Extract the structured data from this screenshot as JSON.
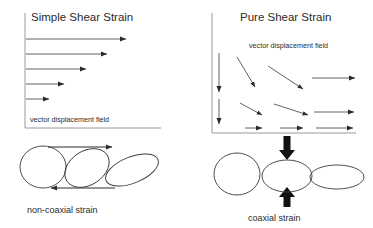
{
  "figure": {
    "width": 373,
    "height": 228,
    "background": "#ffffff",
    "ink_color": "#2b2b2b",
    "axis_color": "#9a9a9a"
  },
  "panels": {
    "left": {
      "title": "Simple Shear Strain",
      "field_label": "vector displacement field",
      "caption": "non-coaxial strain",
      "axis": {
        "vertical": {
          "x": 25,
          "y1": 13,
          "y2": 128
        },
        "horizontal": {
          "y": 128,
          "x1": 25,
          "x2": 161
        }
      },
      "vectors": [
        {
          "x1": 26,
          "y1": 39,
          "x2": 129,
          "y2": 39,
          "direction": "right"
        },
        {
          "x1": 26,
          "y1": 54,
          "x2": 110,
          "y2": 54,
          "direction": "right"
        },
        {
          "x1": 26,
          "y1": 69,
          "x2": 89,
          "y2": 69,
          "direction": "right"
        },
        {
          "x1": 26,
          "y1": 84,
          "x2": 67,
          "y2": 84,
          "direction": "right"
        },
        {
          "x1": 26,
          "y1": 99,
          "x2": 52,
          "y2": 99,
          "direction": "right"
        }
      ],
      "shear_arrows": [
        {
          "name": "top-shear-arrow",
          "x1": 48,
          "y1": 147,
          "x2": 115,
          "y2": 147,
          "direction": "right"
        },
        {
          "name": "bottom-shear-arrow",
          "x1": 115,
          "y1": 188,
          "x2": 48,
          "y2": 188,
          "direction": "left"
        }
      ],
      "ellipses": [
        {
          "name": "circle-undeformed",
          "cx": 43,
          "cy": 167,
          "rx": 23,
          "ry": 21,
          "rotation": 0
        },
        {
          "name": "ellipse-sheared-1",
          "cx": 87,
          "cy": 168,
          "rx": 24,
          "ry": 17,
          "rotation": -33
        },
        {
          "name": "ellipse-sheared-2",
          "cx": 132,
          "cy": 170,
          "rx": 28,
          "ry": 13,
          "rotation": -22
        }
      ]
    },
    "right": {
      "title": "Pure Shear Strain",
      "field_label": "vector displacement field",
      "caption": "coaxial strain",
      "axis": {
        "vertical": {
          "x": 212,
          "y1": 13,
          "y2": 133
        },
        "horizontal": {
          "y": 133,
          "x1": 212,
          "x2": 356
        }
      },
      "vertical_vectors": [
        {
          "x1": 219,
          "y1": 53,
          "x2": 219,
          "y2": 95,
          "direction": "down"
        },
        {
          "x1": 219,
          "y1": 99,
          "x2": 219,
          "y2": 127,
          "direction": "down"
        }
      ],
      "field_rows": [
        {
          "row": 1,
          "vectors": [
            {
              "x1": 237,
              "y1": 57,
              "x2": 257,
              "y2": 90,
              "direction": "down-right"
            },
            {
              "x1": 268,
              "y1": 66,
              "x2": 306,
              "y2": 91,
              "direction": "down-right"
            },
            {
              "x1": 312,
              "y1": 78,
              "x2": 358,
              "y2": 78,
              "direction": "right"
            }
          ]
        },
        {
          "row": 2,
          "vectors": [
            {
              "x1": 240,
              "y1": 103,
              "x2": 264,
              "y2": 117,
              "direction": "down-right"
            },
            {
              "x1": 274,
              "y1": 104,
              "x2": 310,
              "y2": 117,
              "direction": "down-right"
            },
            {
              "x1": 314,
              "y1": 112,
              "x2": 357,
              "y2": 112,
              "direction": "right"
            }
          ]
        },
        {
          "row": 3,
          "vectors": [
            {
              "x1": 245,
              "y1": 128,
              "x2": 265,
              "y2": 128,
              "direction": "right"
            },
            {
              "x1": 280,
              "y1": 128,
              "x2": 306,
              "y2": 128,
              "direction": "right"
            },
            {
              "x1": 316,
              "y1": 128,
              "x2": 356,
              "y2": 128,
              "direction": "right"
            }
          ]
        }
      ],
      "compression_arrows": [
        {
          "name": "top-compression-arrow",
          "x": 287,
          "y1": 137,
          "y2": 157,
          "direction": "down"
        },
        {
          "name": "bottom-compression-arrow",
          "x": 287,
          "y1": 207,
          "y2": 190,
          "direction": "up"
        }
      ],
      "ellipses": [
        {
          "name": "circle-undeformed",
          "cx": 237,
          "cy": 174,
          "rx": 23,
          "ry": 21,
          "rotation": 0
        },
        {
          "name": "ellipse-flattened-1",
          "cx": 287,
          "cy": 176,
          "rx": 25,
          "ry": 16,
          "rotation": 0
        },
        {
          "name": "ellipse-flattened-2",
          "cx": 337,
          "cy": 177,
          "rx": 27,
          "ry": 12,
          "rotation": 0
        }
      ]
    }
  }
}
